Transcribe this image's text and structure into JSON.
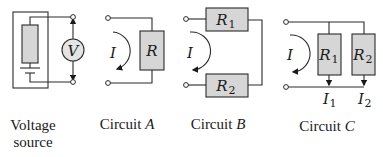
{
  "figure": {
    "voltage_source": {
      "caption_line1": "Voltage",
      "caption_line2": "source",
      "meter_label": "V"
    },
    "circuit_a": {
      "caption_prefix": "Circuit",
      "caption_letter": "A",
      "current_label": "I",
      "resistor_label": "R"
    },
    "circuit_b": {
      "caption_prefix": "Circuit",
      "caption_letter": "B",
      "current_label": "I",
      "resistor1_main": "R",
      "resistor1_sub": "1",
      "resistor2_main": "R",
      "resistor2_sub": "2"
    },
    "circuit_c": {
      "caption_prefix": "Circuit",
      "caption_letter": "C",
      "current_label": "I",
      "resistor1_main": "R",
      "resistor1_sub": "1",
      "resistor2_main": "R",
      "resistor2_sub": "2",
      "branch1_current_main": "I",
      "branch1_current_sub": "1",
      "branch2_current_main": "I",
      "branch2_current_sub": "2"
    }
  },
  "colors": {
    "resistor_fill": "#d6d6d6",
    "meter_fill": "#e4e4e4",
    "line": "#2a2a2a"
  }
}
